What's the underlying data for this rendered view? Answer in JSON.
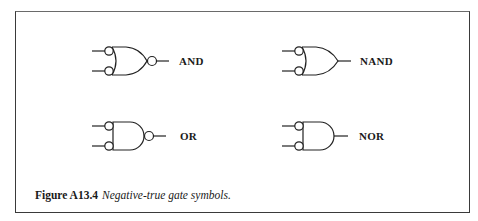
{
  "figure": {
    "number": "Figure A13.4",
    "caption": "Negative-true gate symbols.",
    "border_color": "#3a3a3a"
  },
  "gates": [
    {
      "label": "AND",
      "shape": "or-body",
      "input_bubbles": true,
      "output_bubble": true
    },
    {
      "label": "NAND",
      "shape": "or-body",
      "input_bubbles": true,
      "output_bubble": false
    },
    {
      "label": "OR",
      "shape": "and-body",
      "input_bubbles": true,
      "output_bubble": true
    },
    {
      "label": "NOR",
      "shape": "and-body",
      "input_bubbles": true,
      "output_bubble": false
    }
  ]
}
